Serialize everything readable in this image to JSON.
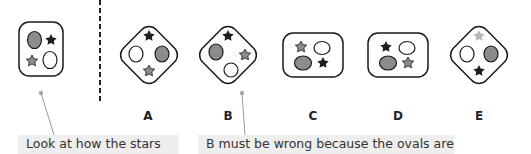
{
  "figures": [
    {
      "id": "question",
      "label": ""
    },
    {
      "id": "A",
      "label": "A"
    },
    {
      "id": "B",
      "label": "B"
    },
    {
      "id": "C",
      "label": "C"
    },
    {
      "id": "D",
      "label": "D"
    },
    {
      "id": "E",
      "label": "E"
    }
  ],
  "colors": {
    "dark_star": "#1e1e1e",
    "grey_star": "#8a8a8a",
    "light_star": "#b8b8b8",
    "grey_oval": "#8c8c8c",
    "white_oval": "#ffffff",
    "outline": "#1a1a1a",
    "annotation_bg": "#eeeeee",
    "pointer": "#999999"
  },
  "annotations": [
    {
      "text": "Look at how the stars"
    },
    {
      "text": "B must be wrong because the ovals are"
    }
  ]
}
